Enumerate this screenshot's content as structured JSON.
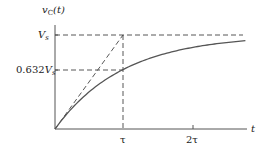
{
  "chart_data": {
    "type": "line",
    "title": "",
    "ylabel": "v_C(t)",
    "ylabel_main": "v",
    "ylabel_sub": "C",
    "ylabel_arg": "(t)",
    "xlabel": "t",
    "x_ticks": [
      {
        "label": "τ",
        "value": 1
      },
      {
        "label": "2τ",
        "value": 2
      }
    ],
    "y_ticks": [
      {
        "label_main": "V",
        "label_sub": "s",
        "label_prefix": "",
        "value": 1.0
      },
      {
        "label_main": "V",
        "label_sub": "s",
        "label_prefix": "0.632",
        "value": 0.632
      }
    ],
    "xlim": [
      0,
      2.8
    ],
    "ylim": [
      0,
      1.0
    ],
    "grid": false,
    "series": [
      {
        "name": "v_C(t) = V_s(1 - e^(-t/τ))",
        "style": "solid",
        "x": [
          0,
          0.25,
          0.5,
          0.75,
          1.0,
          1.25,
          1.5,
          1.75,
          2.0,
          2.25,
          2.5,
          2.8
        ],
        "values": [
          0,
          0.221,
          0.393,
          0.528,
          0.632,
          0.713,
          0.777,
          0.826,
          0.865,
          0.895,
          0.918,
          0.939
        ]
      },
      {
        "name": "initial-slope tangent",
        "style": "dashed",
        "x": [
          0,
          1
        ],
        "values": [
          0,
          1
        ]
      }
    ],
    "reference_lines": [
      {
        "name": "Vs asymptote",
        "style": "dashed",
        "y": 1.0,
        "x_range": [
          0,
          2.8
        ]
      },
      {
        "name": "0.632Vs level",
        "style": "dashed",
        "y": 0.632,
        "x_range": [
          0,
          1
        ]
      },
      {
        "name": "tau marker",
        "style": "dashed",
        "x": 1,
        "y_range": [
          0,
          1.0
        ]
      }
    ]
  },
  "style": {
    "curve_color": "#555555",
    "axis_color": "#555555",
    "dash_color": "#444444"
  }
}
